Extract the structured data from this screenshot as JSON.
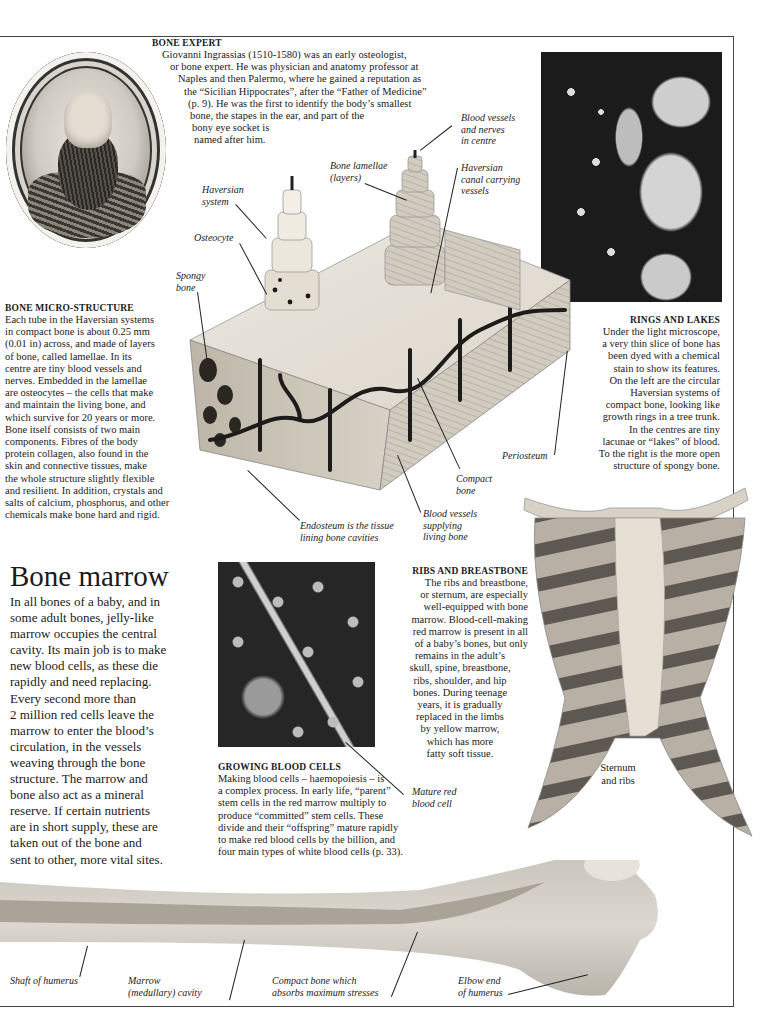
{
  "page": {
    "background": "#ffffff",
    "rule_color": "#444444"
  },
  "bone_expert": {
    "heading": "BONE EXPERT",
    "lines": [
      "Giovanni Ingrassias (1510-1580) was an early osteologist,",
      "or bone expert. He was physician and anatomy professor at",
      "Naples and then Palermo, where he gained a reputation as",
      "the “Sicilian Hippocrates”, after the “Father of Medicine”",
      "(p. 9). He was the first to identify the body’s smallest",
      "bone, the stapes in the ear, and part of the",
      "bony eye socket is",
      "named after him."
    ],
    "portrait_icon": "engraved-portrait-medallion"
  },
  "bone_micro_structure": {
    "heading": "BONE MICRO-STRUCTURE",
    "lines": [
      "Each tube in the Haversian systems",
      "in compact bone is about 0.25 mm",
      "(0.01 in) across, and made of layers",
      "of bone, called lamellae. In its",
      "centre are tiny blood vessels and",
      "nerves. Embedded in the lamellae",
      "are osteocytes – the cells that make",
      "and maintain the living bone, and",
      "which survive for 20 years or more.",
      "Bone itself consists of two main",
      "components. Fibres of the body",
      "protein collagen, also found in the",
      "skin and connective tissues, make",
      "the whole structure slightly flexible",
      "and resilient. In addition, crystals and",
      "salts of calcium, phosphorus, and other",
      "chemicals make bone hard and rigid."
    ]
  },
  "diagram_labels": {
    "blood_vessels_nerves": [
      "Blood vessels",
      "and nerves",
      "in centre"
    ],
    "bone_lamellae": [
      "Bone lamellae",
      "(layers)"
    ],
    "haversian_canal": [
      "Haversian",
      "canal carrying",
      "vessels"
    ],
    "haversian_system": [
      "Haversian",
      "system"
    ],
    "osteocyte": [
      "Osteocyte"
    ],
    "spongy_bone": [
      "Spongy",
      "bone"
    ],
    "periosteum": [
      "Periosteum"
    ],
    "compact_bone": [
      "Compact",
      "bone"
    ],
    "blood_vessels_supplying": [
      "Blood vessels",
      "supplying",
      "living bone"
    ],
    "endosteum": [
      "Endosteum is the tissue",
      "lining bone cavities"
    ]
  },
  "rings_and_lakes": {
    "heading": "RINGS AND LAKES",
    "lines": [
      "Under the light microscope,",
      "a very thin slice of bone has",
      "been dyed with a chemical",
      "stain to show its features.",
      "On the left are the circular",
      "Haversian systems of",
      "compact bone, looking like",
      "growth rings in a tree trunk.",
      "In the centres are tiny",
      "lacunae or “lakes” of blood.",
      "To the right is the more open",
      "structure of spongy bone."
    ]
  },
  "bone_marrow": {
    "title": "Bone marrow",
    "lines": [
      "In all bones of a baby, and in",
      "some adult bones, jelly-like",
      "marrow occupies the central",
      "cavity. Its main job is to make",
      "new blood cells, as these die",
      "rapidly and need replacing.",
      "Every second more than",
      "2 million red cells leave the",
      "marrow to enter the blood’s",
      "circulation, in the vessels",
      "weaving through the bone",
      "structure. The marrow and",
      "bone also act as a mineral",
      "reserve. If certain nutrients",
      "are in short supply, these are",
      "taken out of the bone and",
      "sent to other, more vital sites."
    ]
  },
  "growing_blood_cells": {
    "heading": "GROWING BLOOD CELLS",
    "lines": [
      "Making blood cells – haemopoiesis – is",
      "a complex process. In early life, “parent”",
      "stem cells in the red marrow multiply to",
      "produce “committed” stem cells. These",
      "divide and their “offspring” mature rapidly",
      "to make red blood cells by the billion, and",
      "four main types of white blood cells (p. 33)."
    ],
    "label_mature_red": [
      "Mature red",
      "blood cell"
    ]
  },
  "ribs_and_breastbone": {
    "heading": "RIBS AND BREASTBONE",
    "lines": [
      "The ribs and breastbone,",
      "or sternum, are especially",
      "well-equipped with bone",
      "marrow. Blood-cell-making",
      "red marrow is present in all",
      "of a baby’s bones, but only",
      "remains in the adult’s",
      "skull, spine, breastbone,",
      "ribs, shoulder, and hip",
      "bones. During teenage",
      "years, it is gradually",
      "replaced in the limbs",
      "by yellow marrow,",
      "which has more",
      "fatty soft tissue."
    ],
    "sternum_label": [
      "Sternum",
      "and ribs"
    ]
  },
  "humerus_labels": {
    "shaft": "Shaft of humerus",
    "marrow_cavity": [
      "Marrow",
      "(medullary) cavity"
    ],
    "compact_bone": [
      "Compact bone which",
      "absorbs maximum stresses"
    ],
    "elbow_end": [
      "Elbow end",
      "of humerus"
    ]
  }
}
